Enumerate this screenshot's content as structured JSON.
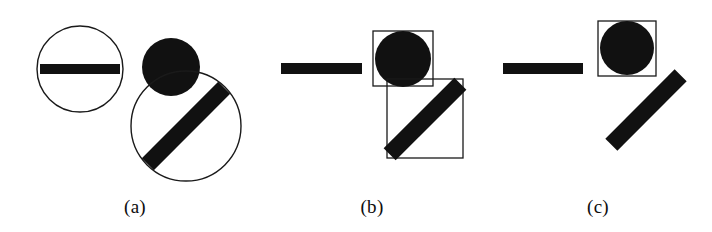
{
  "figure": {
    "width": 712,
    "height": 232,
    "background_color": "#ffffff",
    "ink_color": "#111111",
    "outline_color": "#1a1a1a"
  },
  "panels": [
    {
      "id": "a",
      "label": "(a)",
      "label_center_x": 135,
      "label_y": 212,
      "shapes": [
        {
          "name": "circle-outline-small",
          "type": "circle-outline",
          "cx": 80,
          "cy": 69,
          "r": 43,
          "stroke_width": 1.4
        },
        {
          "name": "bar-horizontal",
          "type": "rect-filled",
          "x": 40,
          "y": 64,
          "width": 80,
          "height": 10,
          "rotation_deg": 0
        },
        {
          "name": "disc-filled",
          "type": "circle-filled",
          "cx": 171,
          "cy": 67,
          "r": 29
        },
        {
          "name": "circle-outline-large",
          "type": "circle-outline",
          "cx": 186,
          "cy": 126,
          "r": 55,
          "stroke_width": 1.4
        },
        {
          "name": "bar-diagonal",
          "type": "rect-filled",
          "cx": 186,
          "cy": 126,
          "width": 108,
          "height": 17,
          "rotation_deg": -45
        }
      ]
    },
    {
      "id": "b",
      "label": "(b)",
      "label_center_x": 372,
      "label_y": 212,
      "shapes": [
        {
          "name": "bar-horizontal",
          "type": "rect-filled",
          "x": 281,
          "y": 63,
          "width": 81,
          "height": 11,
          "rotation_deg": 0
        },
        {
          "name": "bounding-box-disc",
          "type": "rect-outline",
          "x": 373,
          "y": 31,
          "width": 60,
          "height": 55,
          "stroke_width": 1.3
        },
        {
          "name": "disc-filled",
          "type": "circle-filled",
          "cx": 403,
          "cy": 59,
          "r": 28
        },
        {
          "name": "bounding-box-bar",
          "type": "rect-outline",
          "x": 387,
          "y": 79,
          "width": 76,
          "height": 79,
          "stroke_width": 1.3
        },
        {
          "name": "bar-diagonal",
          "type": "rect-filled",
          "cx": 425,
          "cy": 119,
          "width": 100,
          "height": 17,
          "rotation_deg": -45
        }
      ]
    },
    {
      "id": "c",
      "label": "(c)",
      "label_center_x": 598,
      "label_y": 212,
      "shapes": [
        {
          "name": "bar-horizontal",
          "type": "rect-filled",
          "x": 503,
          "y": 63,
          "width": 80,
          "height": 11,
          "rotation_deg": 0
        },
        {
          "name": "bounding-box-disc",
          "type": "rect-outline",
          "x": 598,
          "y": 21,
          "width": 58,
          "height": 55,
          "stroke_width": 1.3
        },
        {
          "name": "disc-filled",
          "type": "circle-filled",
          "cx": 627,
          "cy": 48,
          "r": 27
        },
        {
          "name": "bar-diagonal",
          "type": "rect-filled",
          "cx": 646,
          "cy": 110,
          "width": 98,
          "height": 17,
          "rotation_deg": -45
        }
      ]
    }
  ]
}
